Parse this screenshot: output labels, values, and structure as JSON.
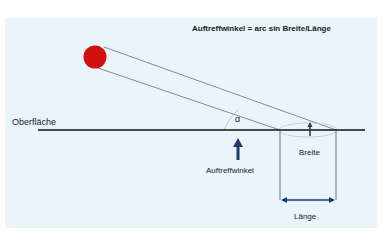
{
  "diagram": {
    "formula": "Auftreffwinkel = arc sin Breite/Länge",
    "surface_label": "Oberfläche",
    "angle_symbol": "α",
    "angle_label": "Auftreffwinkel",
    "width_label": "Breite",
    "length_label": "Länge",
    "colors": {
      "background_panel": "#eaf5fb",
      "projectile": "#d0100e",
      "surface_line": "#111111",
      "arrow": "#1f3a6e",
      "ray_lines": "#8a8a8a"
    }
  }
}
